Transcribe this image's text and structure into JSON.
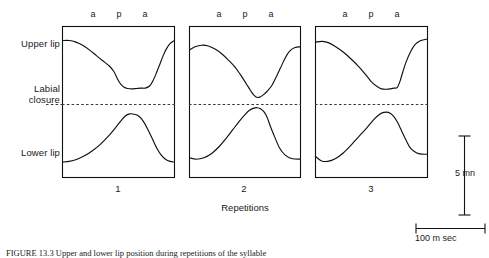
{
  "figure": {
    "y_axis_labels": [
      {
        "id": "upper-lip",
        "text": "Upper lip"
      },
      {
        "id": "labial-closure-line1",
        "text": "Labial"
      },
      {
        "id": "labial-closure-line2",
        "text": "closure"
      },
      {
        "id": "lower-lip",
        "text": "Lower lip"
      }
    ],
    "segment_labels": [
      "a",
      "p",
      "a"
    ],
    "panels": [
      {
        "number": "1"
      },
      {
        "number": "2"
      },
      {
        "number": "3"
      }
    ],
    "x_axis_title": "Repetitions",
    "vertical_scale_label": "5 mn",
    "horizontal_scale_label": "100 m sec",
    "caption": "FIGURE 13.3   Upper and lower lip position during repetitions of the syllable",
    "colors": {
      "trace": "#111111",
      "border": "#111111",
      "dashed": "#3a3a3a",
      "text": "#1a1a1a",
      "background": "#ffffff"
    }
  },
  "chart_data": {
    "type": "line",
    "title": "",
    "xlabel": "Repetitions",
    "ylabel": "",
    "annotations": [
      "a",
      "p",
      "a"
    ],
    "reference_line": {
      "label": "Labial closure",
      "style": "dashed"
    },
    "scale_bars": [
      {
        "orientation": "vertical",
        "label": "5 mn"
      },
      {
        "orientation": "horizontal",
        "label": "100 m sec"
      }
    ],
    "panels": [
      {
        "name": "1",
        "series": [
          {
            "name": "Upper lip",
            "points": [
              [
                0.0,
                0.82
              ],
              [
                0.06,
                0.82
              ],
              [
                0.12,
                0.8
              ],
              [
                0.18,
                0.76
              ],
              [
                0.24,
                0.7
              ],
              [
                0.3,
                0.63
              ],
              [
                0.36,
                0.56
              ],
              [
                0.42,
                0.49
              ],
              [
                0.46,
                0.42
              ],
              [
                0.49,
                0.33
              ],
              [
                0.52,
                0.26
              ],
              [
                0.55,
                0.22
              ],
              [
                0.58,
                0.205
              ],
              [
                0.62,
                0.2
              ],
              [
                0.66,
                0.205
              ],
              [
                0.7,
                0.21
              ],
              [
                0.74,
                0.21
              ],
              [
                0.78,
                0.24
              ],
              [
                0.81,
                0.31
              ],
              [
                0.84,
                0.41
              ],
              [
                0.87,
                0.52
              ],
              [
                0.9,
                0.63
              ],
              [
                0.93,
                0.72
              ],
              [
                0.96,
                0.78
              ],
              [
                1.0,
                0.82
              ]
            ]
          },
          {
            "name": "Lower lip",
            "points": [
              [
                0.0,
                -0.8
              ],
              [
                0.06,
                -0.79
              ],
              [
                0.13,
                -0.76
              ],
              [
                0.2,
                -0.71
              ],
              [
                0.27,
                -0.64
              ],
              [
                0.34,
                -0.55
              ],
              [
                0.41,
                -0.44
              ],
              [
                0.47,
                -0.33
              ],
              [
                0.52,
                -0.23
              ],
              [
                0.56,
                -0.16
              ],
              [
                0.6,
                -0.13
              ],
              [
                0.64,
                -0.135
              ],
              [
                0.68,
                -0.16
              ],
              [
                0.72,
                -0.23
              ],
              [
                0.76,
                -0.34
              ],
              [
                0.8,
                -0.47
              ],
              [
                0.84,
                -0.6
              ],
              [
                0.88,
                -0.7
              ],
              [
                0.92,
                -0.76
              ],
              [
                0.96,
                -0.79
              ],
              [
                1.0,
                -0.8
              ]
            ]
          }
        ]
      },
      {
        "name": "2",
        "series": [
          {
            "name": "Upper lip",
            "points": [
              [
                0.0,
                0.7
              ],
              [
                0.05,
                0.74
              ],
              [
                0.11,
                0.76
              ],
              [
                0.17,
                0.75
              ],
              [
                0.23,
                0.71
              ],
              [
                0.29,
                0.65
              ],
              [
                0.35,
                0.57
              ],
              [
                0.41,
                0.48
              ],
              [
                0.46,
                0.38
              ],
              [
                0.51,
                0.27
              ],
              [
                0.55,
                0.18
              ],
              [
                0.58,
                0.12
              ],
              [
                0.61,
                0.09
              ],
              [
                0.64,
                0.1
              ],
              [
                0.67,
                0.13
              ],
              [
                0.7,
                0.17
              ],
              [
                0.74,
                0.24
              ],
              [
                0.78,
                0.35
              ],
              [
                0.82,
                0.47
              ],
              [
                0.86,
                0.59
              ],
              [
                0.9,
                0.68
              ],
              [
                0.95,
                0.73
              ],
              [
                1.0,
                0.74
              ]
            ]
          },
          {
            "name": "Lower lip",
            "points": [
              [
                0.0,
                -0.74
              ],
              [
                0.06,
                -0.76
              ],
              [
                0.13,
                -0.74
              ],
              [
                0.2,
                -0.68
              ],
              [
                0.27,
                -0.58
              ],
              [
                0.33,
                -0.47
              ],
              [
                0.39,
                -0.35
              ],
              [
                0.45,
                -0.23
              ],
              [
                0.5,
                -0.14
              ],
              [
                0.54,
                -0.08
              ],
              [
                0.58,
                -0.05
              ],
              [
                0.61,
                -0.045
              ],
              [
                0.64,
                -0.06
              ],
              [
                0.67,
                -0.1
              ],
              [
                0.7,
                -0.18
              ],
              [
                0.73,
                -0.31
              ],
              [
                0.77,
                -0.46
              ],
              [
                0.81,
                -0.6
              ],
              [
                0.86,
                -0.7
              ],
              [
                0.92,
                -0.75
              ],
              [
                1.0,
                -0.76
              ]
            ]
          }
        ]
      },
      {
        "name": "3",
        "series": [
          {
            "name": "Upper lip",
            "points": [
              [
                0.0,
                0.8
              ],
              [
                0.06,
                0.81
              ],
              [
                0.12,
                0.79
              ],
              [
                0.18,
                0.74
              ],
              [
                0.25,
                0.67
              ],
              [
                0.32,
                0.58
              ],
              [
                0.39,
                0.48
              ],
              [
                0.45,
                0.38
              ],
              [
                0.5,
                0.29
              ],
              [
                0.55,
                0.23
              ],
              [
                0.59,
                0.2
              ],
              [
                0.63,
                0.195
              ],
              [
                0.67,
                0.2
              ],
              [
                0.7,
                0.21
              ],
              [
                0.73,
                0.22
              ],
              [
                0.755,
                0.3
              ],
              [
                0.78,
                0.42
              ],
              [
                0.81,
                0.55
              ],
              [
                0.85,
                0.68
              ],
              [
                0.89,
                0.77
              ],
              [
                0.94,
                0.82
              ],
              [
                1.0,
                0.84
              ]
            ]
          },
          {
            "name": "Lower lip",
            "points": [
              [
                0.0,
                -0.72
              ],
              [
                0.05,
                -0.78
              ],
              [
                0.11,
                -0.79
              ],
              [
                0.18,
                -0.75
              ],
              [
                0.25,
                -0.67
              ],
              [
                0.32,
                -0.56
              ],
              [
                0.39,
                -0.44
              ],
              [
                0.46,
                -0.32
              ],
              [
                0.52,
                -0.21
              ],
              [
                0.57,
                -0.14
              ],
              [
                0.61,
                -0.11
              ],
              [
                0.65,
                -0.11
              ],
              [
                0.69,
                -0.15
              ],
              [
                0.73,
                -0.24
              ],
              [
                0.77,
                -0.37
              ],
              [
                0.81,
                -0.5
              ],
              [
                0.85,
                -0.61
              ],
              [
                0.9,
                -0.67
              ],
              [
                0.95,
                -0.69
              ],
              [
                1.0,
                -0.69
              ]
            ]
          }
        ]
      }
    ]
  }
}
